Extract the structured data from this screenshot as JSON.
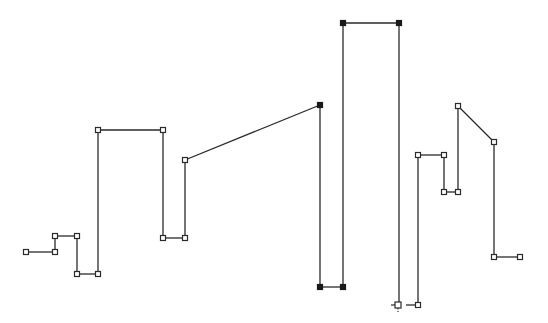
{
  "canvas": {
    "width": 548,
    "height": 323,
    "background": "#ffffff"
  },
  "drawing": {
    "type": "polyline",
    "stroke_color": "#2a2a2a",
    "selected_color": "#1a1a1a",
    "handle_size": 5,
    "gap_after_index": 15,
    "vertices": [
      {
        "x": 26,
        "y": 252,
        "selected": false
      },
      {
        "x": 55,
        "y": 252,
        "selected": false
      },
      {
        "x": 55,
        "y": 236,
        "selected": false
      },
      {
        "x": 77,
        "y": 236,
        "selected": false
      },
      {
        "x": 77,
        "y": 274,
        "selected": false
      },
      {
        "x": 98,
        "y": 274,
        "selected": false
      },
      {
        "x": 98,
        "y": 130,
        "selected": false
      },
      {
        "x": 163,
        "y": 130,
        "selected": false
      },
      {
        "x": 163,
        "y": 238,
        "selected": false
      },
      {
        "x": 185,
        "y": 238,
        "selected": false
      },
      {
        "x": 185,
        "y": 160,
        "selected": false
      },
      {
        "x": 320,
        "y": 105,
        "selected": true
      },
      {
        "x": 320,
        "y": 287,
        "selected": true
      },
      {
        "x": 343,
        "y": 287,
        "selected": true
      },
      {
        "x": 343,
        "y": 23,
        "selected": true
      },
      {
        "x": 399,
        "y": 23,
        "selected": true
      },
      {
        "x": 399,
        "y": 305,
        "selected": false
      },
      {
        "x": 418,
        "y": 305,
        "selected": false
      },
      {
        "x": 418,
        "y": 155,
        "selected": false
      },
      {
        "x": 444,
        "y": 155,
        "selected": false
      },
      {
        "x": 444,
        "y": 192,
        "selected": false
      },
      {
        "x": 458,
        "y": 192,
        "selected": false
      },
      {
        "x": 458,
        "y": 106,
        "selected": false
      },
      {
        "x": 494,
        "y": 142,
        "selected": false
      },
      {
        "x": 494,
        "y": 257,
        "selected": false
      },
      {
        "x": 520,
        "y": 257,
        "selected": false
      }
    ]
  },
  "cursor": {
    "icon": "crosshair-cursor-icon",
    "x": 398,
    "y": 305
  }
}
